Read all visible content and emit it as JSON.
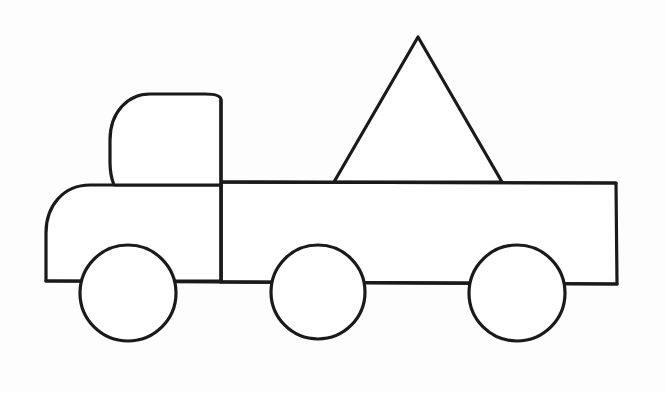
{
  "document": {
    "title": "Truck Outline Coloring Page",
    "subject": "truck",
    "style": "black-and-white line drawing",
    "background_color": "#fdfdfd",
    "stroke_color": "#1a1a1a",
    "fill_color": "#ffffff",
    "stroke_width": 3.2,
    "width": 665,
    "height": 393
  },
  "shapes": {
    "cab": {
      "name": "Truck cab with rounded roof",
      "path": "M 221 100 C 221 96 215 94 205 94 L 150 94 C 128 94 110 112 110 140 L 110 162 C 110 174 112 180 114 185 L 221 185 Z",
      "label": "cab"
    },
    "hood": {
      "name": "Rounded front hood",
      "path": "M 114 185 L 90 185 C 64 185 46 205 46 233 L 46 281 L 221 281 L 221 185 Z",
      "label": "hood"
    },
    "bed": {
      "name": "Cargo bed rectangle",
      "path": "M 221 182 L 616 183 L 617 284 L 221 282 Z",
      "x": 221,
      "y": 182,
      "width": 396,
      "height": 101,
      "label": "bed"
    },
    "triangle": {
      "name": "Triangular cargo load",
      "points": "418,37 502,182 334,182",
      "apex_x": 418,
      "apex_y": 37,
      "base_left_x": 334,
      "base_right_x": 502,
      "base_y": 182,
      "label": "cargo-triangle"
    },
    "chassis_line": {
      "name": "Chassis bottom line",
      "path": "M 46 281 L 617 284",
      "label": "chassis"
    },
    "wheels": [
      {
        "label": "front-wheel",
        "cx": 128,
        "cy": 293,
        "r": 48
      },
      {
        "label": "middle-wheel",
        "cx": 318,
        "cy": 292,
        "r": 47
      },
      {
        "label": "rear-wheel",
        "cx": 517,
        "cy": 293,
        "r": 48
      }
    ]
  },
  "counts": {
    "wheels": 3,
    "triangles": 1,
    "rectangles": 1,
    "circles": 3
  }
}
